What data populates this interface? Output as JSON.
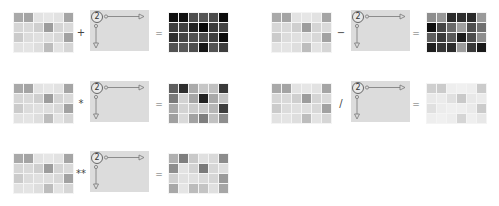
{
  "base_grid": [
    [
      "#a9a9a9",
      "#a4a4a4",
      "#e3e3e3",
      "#e6e6e6",
      "#e2e2e2",
      "#a5a5a5"
    ],
    [
      "#d6d6d6",
      "#d9d9d9",
      "#cfcfcf",
      "#9d9d9d",
      "#d5d5d5",
      "#dadada"
    ],
    [
      "#cbcbcb",
      "#dcdcdc",
      "#e0e0e0",
      "#dedede",
      "#d8d8d8",
      "#a2a2a2"
    ],
    [
      "#e2e2e2",
      "#e4e4e4",
      "#dedede",
      "#bdbdbd",
      "#e3e3e3",
      "#d6d6d6"
    ]
  ],
  "scalar": {
    "value": "2",
    "axes": "broadcast-arrows"
  },
  "equals": "=",
  "examples": [
    {
      "operator": "+",
      "result": [
        [
          "#0e0e0e",
          "#111111",
          "#4e4e4e",
          "#555555",
          "#4b4b4b",
          "#0c0c0c"
        ],
        [
          "#3e3e3e",
          "#414141",
          "#222222",
          "#080808",
          "#3b3b3b",
          "#444444"
        ],
        [
          "#2f2f2f",
          "#454545",
          "#505050",
          "#4d4d4d",
          "#3f3f3f",
          "#0a0a0a"
        ],
        [
          "#525252",
          "#585858",
          "#4d4d4d",
          "#161616",
          "#535353",
          "#3e3e3e"
        ]
      ]
    },
    {
      "operator": "−",
      "result": [
        [
          "#8e8e8e",
          "#989898",
          "#2a2a2a",
          "#2e2e2e",
          "#2a2a2a",
          "#9a9a9a"
        ],
        [
          "#0e0e0e",
          "#454545",
          "#6a6a6a",
          "#a0a0a0",
          "#4e4e4e",
          "#707070"
        ],
        [
          "#5e5e5e",
          "#3a3a3a",
          "#5a5a5a",
          "#1c1c1c",
          "#4c4c4c",
          "#8e8e8e"
        ],
        [
          "#1e1e1e",
          "#363636",
          "#2c2c2c",
          "#9c9c9c",
          "#3a3a3a",
          "#1a1a1a"
        ]
      ]
    },
    {
      "operator": "*",
      "result": [
        [
          "#5e5e5e",
          "#2e2e2e",
          "#aaaaaa",
          "#c6c6c6",
          "#c0c0c0",
          "#3a3a3a"
        ],
        [
          "#7a7a7a",
          "#d2d2d2",
          "#a6a6a6",
          "#222222",
          "#a9a9a9",
          "#c5c5c5"
        ],
        [
          "#a8a8a8",
          "#d3d3d3",
          "#cccccc",
          "#c9c9c9",
          "#b6b6b6",
          "#3e3e3e"
        ],
        [
          "#a0a0a0",
          "#d9d9d9",
          "#a2a2a2",
          "#7e7e7e",
          "#c1c1c1",
          "#8e8e8e"
        ]
      ]
    },
    {
      "operator": "/",
      "result": [
        [
          "#cfcfcf",
          "#cbcbcb",
          "#eeeeee",
          "#f0f0f0",
          "#eeeeee",
          "#cbcbcb"
        ],
        [
          "#e9e9e9",
          "#ebebeb",
          "#e0e0e0",
          "#c9c9c9",
          "#e8e8e8",
          "#ebebeb"
        ],
        [
          "#e0e0e0",
          "#ececec",
          "#efefef",
          "#eeeeee",
          "#eaeaea",
          "#cbcbcb"
        ],
        [
          "#eeeeee",
          "#f0f0f0",
          "#ededed",
          "#d5d5d5",
          "#efefef",
          "#e8e8e8"
        ]
      ]
    },
    {
      "operator": "**",
      "result": [
        [
          "#b0b0b0",
          "#7e7e7e",
          "#c9c9c9",
          "#e0e0e0",
          "#d9d9d9",
          "#8c8c8c"
        ],
        [
          "#8e8e8e",
          "#e3e3e3",
          "#d3d3d3",
          "#7a7a7a",
          "#d7d7d7",
          "#dedede"
        ],
        [
          "#d0d0d0",
          "#e1e1e1",
          "#e0e0e0",
          "#dadada",
          "#d6d6d6",
          "#9a9a9a"
        ],
        [
          "#a8a8a8",
          "#e5e5e5",
          "#bcbcbc",
          "#c4c4c4",
          "#e0e0e0",
          "#a6a6a6"
        ]
      ]
    }
  ]
}
